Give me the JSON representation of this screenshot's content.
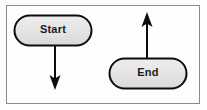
{
  "diagram": {
    "frame": {
      "border_color": "#8a8a8a",
      "background_color": "#fefefe"
    },
    "nodes": [
      {
        "id": "start",
        "label": "Start",
        "shape": "stadium",
        "fill_color": "#e3e3e3",
        "stroke_color": "#0d0d0d",
        "x": 14,
        "y": 15,
        "width": 78,
        "height": 31
      },
      {
        "id": "end",
        "label": "End",
        "shape": "stadium",
        "fill_color": "#e3e3e3",
        "stroke_color": "#0d0d0d",
        "x": 109,
        "y": 58,
        "width": 78,
        "height": 31
      }
    ],
    "arrows": [
      {
        "id": "start-outgoing",
        "direction": "down",
        "color": "#0d0d0d",
        "from_x": 55,
        "from_y": 46,
        "to_x": 55,
        "to_y": 89
      },
      {
        "id": "end-incoming",
        "direction": "up",
        "color": "#0d0d0d",
        "from_x": 147,
        "from_y": 58,
        "to_x": 147,
        "to_y": 13
      }
    ]
  }
}
